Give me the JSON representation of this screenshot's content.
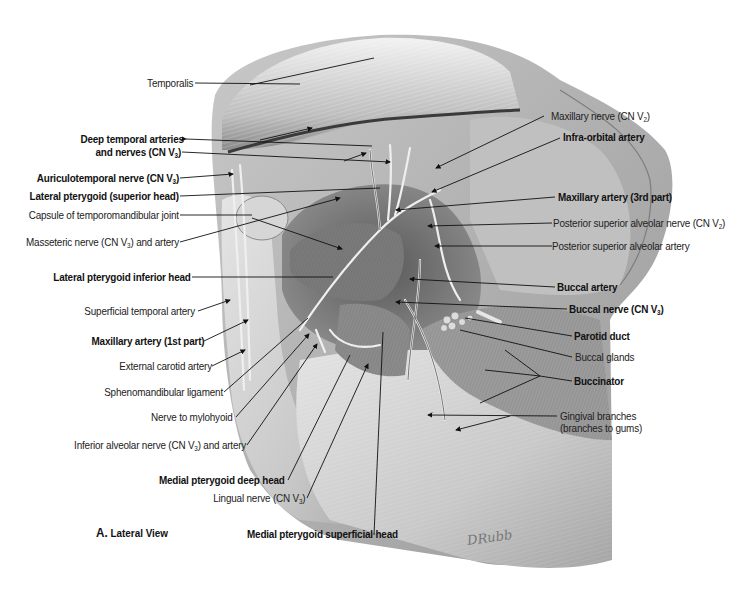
{
  "figure": {
    "caption_letter": "A.",
    "caption_text": "Lateral View",
    "signature": "DRubb",
    "colors": {
      "background": "#ffffff",
      "ink": "#222222",
      "tissue_light": "#d9d9d9",
      "tissue_dark": "#6e6e6e"
    }
  },
  "labels_left": [
    {
      "id": "temporalis",
      "text": "Temporalis",
      "bold": false
    },
    {
      "id": "deep-temporal",
      "text": "Deep temporal arteries",
      "bold": true
    },
    {
      "id": "deep-temporal-2",
      "text": "and nerves (CN V",
      "sub": "3",
      "tail": ")",
      "bold": true
    },
    {
      "id": "auriculotemporal",
      "text": "Auriculotemporal nerve (CN V",
      "sub": "3",
      "tail": ")",
      "bold": true
    },
    {
      "id": "lat-pterygoid-sup",
      "text": "Lateral pterygoid (superior head)",
      "bold": true
    },
    {
      "id": "tmj-capsule",
      "text": "Capsule of temporomandibular joint",
      "bold": false
    },
    {
      "id": "masseteric",
      "text": "Masseteric nerve (CN V",
      "sub": "3",
      "tail": ") and artery",
      "bold": false
    },
    {
      "id": "lat-pterygoid-inf",
      "text": "Lateral pterygoid inferior head",
      "bold": true
    },
    {
      "id": "superficial-temporal",
      "text": "Superficial temporal artery",
      "bold": false
    },
    {
      "id": "maxillary-1st",
      "text": "Maxillary artery (1st part)",
      "bold": true
    },
    {
      "id": "external-carotid",
      "text": "External carotid artery",
      "bold": false
    },
    {
      "id": "sphenomandibular",
      "text": "Sphenomandibular ligament",
      "bold": false
    },
    {
      "id": "nerve-mylohyoid",
      "text": "Nerve to mylohyoid",
      "bold": false
    },
    {
      "id": "inferior-alveolar",
      "text": "Inferior alveolar nerve (CN V",
      "sub": "3",
      "tail": ") and artery",
      "bold": false
    },
    {
      "id": "med-pterygoid-deep",
      "text": "Medial pterygoid deep head",
      "bold": true
    },
    {
      "id": "lingual",
      "text": "Lingual nerve (CN V",
      "sub": "3",
      "tail": ")",
      "bold": false
    },
    {
      "id": "med-pterygoid-sup",
      "text": "Medial pterygoid superficial head",
      "bold": true
    }
  ],
  "labels_right": [
    {
      "id": "maxillary-nerve",
      "text": "Maxillary nerve (CN V",
      "sub": "2",
      "tail": ")",
      "bold": false
    },
    {
      "id": "infra-orbital",
      "text": "Infra-orbital artery",
      "bold": true
    },
    {
      "id": "maxillary-3rd",
      "text": "Maxillary artery (3rd part)",
      "bold": true
    },
    {
      "id": "psa-nerve",
      "text": "Posterior superior alveolar nerve (CN V",
      "sub": "2",
      "tail": ")",
      "bold": false
    },
    {
      "id": "psa-artery",
      "text": "Posterior superior alveolar artery",
      "bold": false
    },
    {
      "id": "buccal-artery",
      "text": "Buccal artery",
      "bold": true
    },
    {
      "id": "buccal-nerve",
      "text": "Buccal nerve (CN V",
      "sub": "3",
      "tail": ")",
      "bold": true
    },
    {
      "id": "parotid-duct",
      "text": "Parotid duct",
      "bold": true
    },
    {
      "id": "buccal-glands",
      "text": "Buccal glands",
      "bold": false
    },
    {
      "id": "buccinator",
      "text": "Buccinator",
      "bold": true
    },
    {
      "id": "gingival-1",
      "text": "Gingival branches",
      "bold": false
    },
    {
      "id": "gingival-2",
      "text": "(branches to gums)",
      "bold": false
    }
  ]
}
